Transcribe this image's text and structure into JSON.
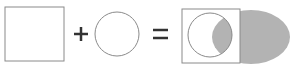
{
  "diagram": {
    "operators": {
      "plus": "+",
      "equals": "="
    },
    "colors": {
      "stroke": "#8a8a8a",
      "shade": "#b3b3b3",
      "operator": "#333333",
      "background": "#ffffff"
    },
    "elements": [
      {
        "name": "square",
        "label": ""
      },
      {
        "name": "circle",
        "label": ""
      },
      {
        "name": "result",
        "label": ""
      }
    ]
  }
}
